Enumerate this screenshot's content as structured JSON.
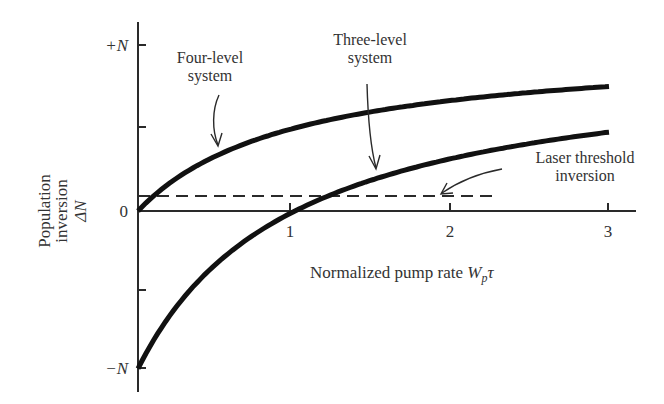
{
  "chart_data": {
    "type": "line",
    "title": "",
    "xlabel": "Normalized pump rate W_p τ",
    "xlabel_parts": {
      "main": "Normalized pump rate ",
      "var": "W",
      "sub": "p",
      "tau": "τ"
    },
    "ylabel_lines": [
      "Population",
      "inversion",
      "ΔN"
    ],
    "xlim": [
      0,
      3.2
    ],
    "ylim": [
      -1,
      1
    ],
    "x_ticks": [
      {
        "value": 1,
        "label": "1"
      },
      {
        "value": 2,
        "label": "2"
      },
      {
        "value": 3,
        "label": "3"
      }
    ],
    "y_ticks": [
      {
        "value": 1,
        "label": "+N"
      },
      {
        "value": 0.5,
        "label": ""
      },
      {
        "value": 0,
        "label": "0"
      },
      {
        "value": -0.5,
        "label": ""
      },
      {
        "value": -1,
        "label": "−N"
      }
    ],
    "grid": false,
    "legend": "none (inline annotations with arrows)",
    "series": [
      {
        "name": "Four-level system",
        "formula": "ΔN/N = Wτ/(1+Wτ)",
        "x": [
          0,
          0.25,
          0.5,
          0.75,
          1,
          1.5,
          2,
          2.5,
          3
        ],
        "values": [
          0,
          0.2,
          0.333,
          0.429,
          0.5,
          0.6,
          0.667,
          0.714,
          0.75
        ]
      },
      {
        "name": "Three-level system",
        "formula": "ΔN/N = (Wτ−1)/(Wτ+1)",
        "x": [
          0,
          0.25,
          0.5,
          0.75,
          1,
          1.5,
          2,
          2.5,
          3
        ],
        "values": [
          -1,
          -0.6,
          -0.333,
          -0.143,
          0,
          0.2,
          0.333,
          0.429,
          0.5
        ]
      },
      {
        "name": "Laser threshold inversion",
        "style": "dashed",
        "x": [
          0,
          2.27
        ],
        "values": [
          0.09,
          0.09
        ]
      }
    ],
    "annotations": [
      {
        "text_lines": [
          "Four-level",
          "system"
        ],
        "points_to": "four-level curve near x≈0.5"
      },
      {
        "text_lines": [
          "Three-level",
          "system"
        ],
        "points_to": "three-level curve near x≈1.5"
      },
      {
        "text_lines": [
          "Laser threshold",
          "inversion"
        ],
        "points_to": "dashed line near x≈1.9"
      }
    ]
  },
  "labels": {
    "y_plus": "+N",
    "y_zero": "0",
    "y_minus": "−N",
    "x1": "1",
    "x2": "2",
    "x3": "3",
    "ylabel_1": "Population",
    "ylabel_2": "inversion",
    "ylabel_3": "ΔN",
    "four_1": "Four-level",
    "four_2": "system",
    "three_1": "Three-level",
    "three_2": "system",
    "thr_1": "Laser threshold",
    "thr_2": "inversion",
    "xlabel_main": "Normalized pump rate ",
    "xlabel_var": "W",
    "xlabel_sub": "p",
    "xlabel_tau": "τ"
  }
}
